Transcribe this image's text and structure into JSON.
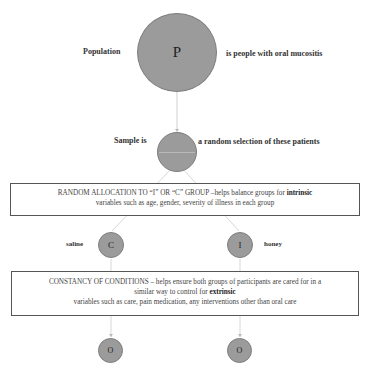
{
  "population": {
    "symbol": "P",
    "label_left": "Population",
    "label_right": "is people with oral mucositis"
  },
  "sample": {
    "label_left": "Sample is",
    "label_right": "a random selection of these patients"
  },
  "random_allocation": {
    "text_prefix": "RANDOM ALLOCATION TO “I” OR “C” GROUP –helps balance groups for ",
    "bold": "intrinsic",
    "text_line2": "variables such as age, gender, severity of illness in each group"
  },
  "groups": {
    "control": {
      "symbol": "C",
      "label": "saline"
    },
    "intervention": {
      "symbol": "I",
      "label": "honey"
    }
  },
  "constancy": {
    "line1": "CONSTANCY OF CONDITIONS – helps ensure both groups of participants are cared for in a",
    "line2_prefix": "similar way to control for ",
    "bold": "extrinsic",
    "line3": "variables such as care, pain medication, any interventions other than oral care"
  },
  "outcomes": {
    "left_symbol": "O",
    "right_symbol": "O"
  },
  "colors": {
    "circle_fill": "#9b9b9b",
    "circle_border": "#7e7e7e",
    "connector": "#d0d0d0"
  }
}
